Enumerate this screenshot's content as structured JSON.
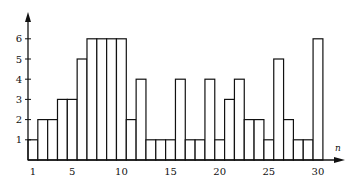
{
  "chart_data": {
    "type": "bar",
    "title": "",
    "xlabel": "n",
    "ylabel": "",
    "categories": [
      1,
      2,
      3,
      4,
      5,
      6,
      7,
      8,
      9,
      10,
      11,
      12,
      13,
      14,
      15,
      16,
      17,
      18,
      19,
      20,
      21,
      22,
      23,
      24,
      25,
      26,
      27,
      28,
      29,
      30
    ],
    "values": [
      1,
      2,
      2,
      3,
      3,
      5,
      6,
      6,
      6,
      6,
      2,
      4,
      1,
      1,
      1,
      4,
      1,
      1,
      4,
      1,
      3,
      4,
      2,
      2,
      1,
      5,
      2,
      1,
      1,
      6
    ],
    "x_tick_labels": [
      "1",
      "5",
      "10",
      "15",
      "20",
      "25",
      "30"
    ],
    "y_tick_labels": [
      "1",
      "2",
      "3",
      "4",
      "5",
      "6"
    ],
    "ylim": [
      0,
      7
    ],
    "grid": false,
    "legend": null,
    "bar_fill": "#ffffff",
    "bar_stroke": "#111111"
  }
}
